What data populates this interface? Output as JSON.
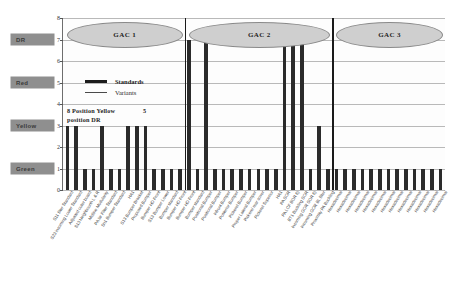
{
  "chart_data": {
    "type": "bar",
    "title": "",
    "xlabel": "",
    "ylabel": "",
    "ylim": [
      0,
      8
    ],
    "yticks": [
      0,
      1,
      2,
      3,
      4,
      5,
      6,
      7,
      8
    ],
    "grid": true,
    "legend_position": "upper-left-inside",
    "legend": [
      {
        "label": "Standards",
        "style": "thick-line"
      },
      {
        "label": "Variants",
        "style": "thin-line"
      }
    ],
    "annotations": [
      {
        "text": "8 Position Yellow",
        "value": "5"
      },
      {
        "text": "position DR"
      }
    ],
    "y_category_labels": [
      {
        "label": "DR",
        "value": 7
      },
      {
        "label": "Red",
        "value": 5
      },
      {
        "label": "Yellow",
        "value": 3
      },
      {
        "label": "Green",
        "value": 1
      }
    ],
    "groups": [
      {
        "name": "GAC 1",
        "start_index": 0,
        "end_index": 13
      },
      {
        "name": "GAC 2",
        "start_index": 14,
        "end_index": 30
      },
      {
        "name": "GAC 3",
        "start_index": 31,
        "end_index": 43
      }
    ],
    "categories": [
      "S11 filter Standard",
      "S23 incoming Lower Standard",
      "Adjusted outer board",
      "S13 Neighbourth L & R",
      "Midline Modularity",
      "PA lar Filter Standard",
      "Sn1 Bumper Standard",
      "HA1",
      "S13 Bumper Bracket",
      "Proposed Bumper",
      "Bumper HD Front",
      "S13 Bumper Lower",
      "Bumper standard",
      "Bumper HD Front",
      "Bumper HD Front",
      "Bumper standard",
      "Positional Bumper",
      "Positional Bumper",
      "Infront Bumper",
      "Posterior Bumper",
      "Pickerel Bumper",
      "Proper Lateral Bumper",
      "Pickerel rear cover",
      "Pickerel Superior",
      "HA1",
      "PA SOR",
      "PA LCF BOR 6)",
      "BT1 Buckling SOR",
      "Incoming GOR SOR 6)",
      "Incoming GOR BL filter",
      "Proximity PA Buckling",
      "Hexadecimal",
      "Hexadecimal",
      "Hexadecimal",
      "Hexadecimal",
      "Hexadecimal",
      "Hexadecimal",
      "Hexadecimal",
      "Hexadecimal",
      "Hexadecimal",
      "Hexadecimal",
      "Hexadecimal",
      "Hexadecimal",
      "Hexadecimal"
    ],
    "values": [
      3,
      3,
      1,
      1,
      3,
      1,
      1,
      3,
      3,
      3,
      1,
      1,
      1,
      1,
      7,
      1,
      7,
      1,
      1,
      1,
      1,
      1,
      1,
      1,
      1,
      7,
      7,
      7,
      1,
      3,
      1,
      1,
      1,
      1,
      1,
      1,
      1,
      1,
      1,
      1,
      1,
      1,
      1,
      1
    ],
    "bar_color": "#2b2b2b",
    "group_ellipse_color": "#cfcfcf",
    "separator_color": "#1a1a1a",
    "grid_color": "#b9b9b9",
    "category_label_bg": "#8f8f8f"
  }
}
